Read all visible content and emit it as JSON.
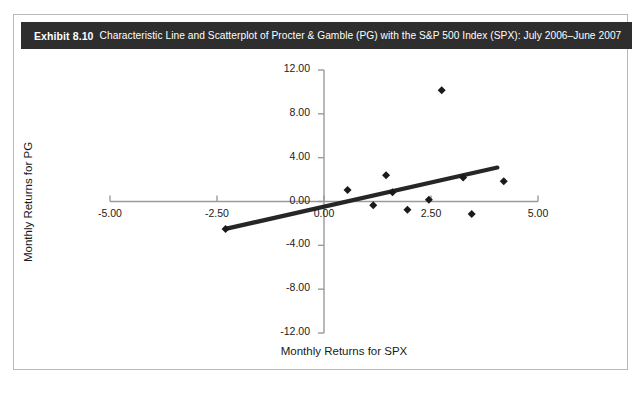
{
  "exhibit": {
    "label": "Exhibit 8.10",
    "title": "Characteristic Line and Scatterplot of Procter & Gamble (PG) with the S&P 500 Index (SPX): July 2006–June 2007",
    "header_bg": "#2e2e2e",
    "header_fg": "#ffffff"
  },
  "chart_data": {
    "type": "scatter",
    "title": "Characteristic Line and Scatterplot of Procter & Gamble (PG) with the S&P 500 Index (SPX): July 2006–June 2007",
    "xlabel": "Monthly Returns for SPX",
    "ylabel": "Monthly Returns for PG",
    "xlim": [
      -5.0,
      5.0
    ],
    "ylim": [
      -12.0,
      12.0
    ],
    "xticks": [
      -5.0,
      -2.5,
      0.0,
      2.5,
      5.0
    ],
    "yticks": [
      12.0,
      8.0,
      4.0,
      0.0,
      -4.0,
      -8.0,
      -12.0
    ],
    "xtick_labels": [
      "-5.00",
      "-2.50",
      "0.00",
      "2.50",
      "5.00"
    ],
    "ytick_labels": [
      "12.00",
      "8.00",
      "4.00",
      "0.00",
      "-4.00",
      "-8.00",
      "-12.00"
    ],
    "grid": false,
    "legend": null,
    "marker": "diamond",
    "marker_color": "#1a1a1a",
    "line_color": "#262626",
    "axis_color": "#9a9a9a",
    "series": [
      {
        "name": "Monthly returns (SPX vs PG)",
        "type": "scatter",
        "points": [
          {
            "x": -2.3,
            "y": -2.5
          },
          {
            "x": 0.55,
            "y": 1.05
          },
          {
            "x": 1.15,
            "y": -0.35
          },
          {
            "x": 1.45,
            "y": 2.4
          },
          {
            "x": 1.6,
            "y": 0.85
          },
          {
            "x": 1.95,
            "y": -0.75
          },
          {
            "x": 2.45,
            "y": 0.15
          },
          {
            "x": 2.75,
            "y": 10.15
          },
          {
            "x": 3.25,
            "y": 2.2
          },
          {
            "x": 3.45,
            "y": -1.15
          },
          {
            "x": 4.2,
            "y": 1.85
          }
        ]
      },
      {
        "name": "Characteristic line",
        "type": "line",
        "points": [
          {
            "x": -2.3,
            "y": -2.5
          },
          {
            "x": 4.05,
            "y": 3.1
          }
        ]
      }
    ]
  }
}
